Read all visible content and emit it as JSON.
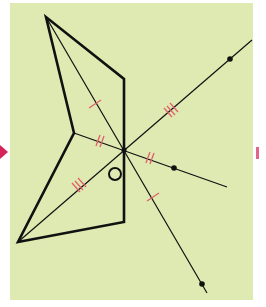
{
  "diagram": {
    "type": "central-symmetry-construction",
    "background_color": "#dfeab2",
    "line_color": "#111111",
    "tick_color": "#e0606a",
    "center_label": "O",
    "center": {
      "x": 124,
      "y": 150
    },
    "figure_vertices": [
      {
        "x": 46,
        "y": 17
      },
      {
        "x": 124,
        "y": 79
      },
      {
        "x": 124,
        "y": 150
      },
      {
        "x": 124,
        "y": 222
      },
      {
        "x": 18,
        "y": 242
      },
      {
        "x": 74,
        "y": 133
      }
    ],
    "segments_through_center": [
      {
        "from": {
          "x": 46,
          "y": 17
        },
        "to": {
          "x": 207,
          "y": 293
        },
        "image_point": {
          "x": 202,
          "y": 284
        },
        "tick_marks": 1
      },
      {
        "from": {
          "x": 74,
          "y": 133
        },
        "to": {
          "x": 227,
          "y": 187
        },
        "image_point": {
          "x": 174,
          "y": 168
        },
        "tick_marks": 2
      },
      {
        "from": {
          "x": 18,
          "y": 242
        },
        "to": {
          "x": 252,
          "y": 40
        },
        "image_point": {
          "x": 230,
          "y": 59
        },
        "tick_marks": 3
      }
    ]
  }
}
